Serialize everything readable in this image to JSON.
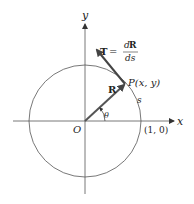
{
  "diagram": {
    "axes": {
      "x_label": "x",
      "y_label": "y",
      "origin_label": "O"
    },
    "circle": {
      "description": "unit circle",
      "point_on_x_axis_label": "(1, 0)"
    },
    "vectors": {
      "position": {
        "label": "R"
      },
      "tangent": {
        "label_lhs": "T",
        "equals": "=",
        "numerator_d": "d",
        "numerator_bold": "R",
        "denominator": "ds"
      }
    },
    "point": {
      "label": "P(x, y)"
    },
    "angle": {
      "label": "θ"
    },
    "arc": {
      "label": "s"
    }
  }
}
